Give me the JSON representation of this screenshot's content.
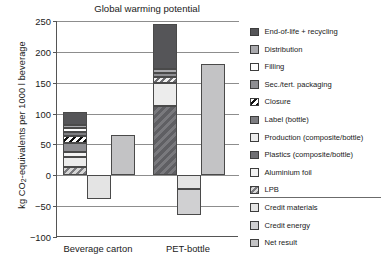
{
  "chart_data": {
    "type": "bar",
    "title": "Global warming potential",
    "xlabel": "",
    "ylabel": "kg CO2-equivalents per 1000 l beverage",
    "ylabel_prefix": "kg CO",
    "ylabel_sub": "2",
    "ylabel_suffix": "-equivalents per 1000 l beverage",
    "ylim": [
      -100,
      250
    ],
    "yticks": [
      250,
      200,
      150,
      100,
      50,
      0,
      -50,
      -100
    ],
    "ytick_labels": [
      "250",
      "200",
      "150",
      "100",
      "50",
      "0",
      "−50",
      "−100"
    ],
    "grid": true,
    "legend_position": "right",
    "categories": [
      "Beverage carton",
      "PET-bottle"
    ],
    "stack_order": [
      "LPB",
      "Production (composite/bottle)",
      "Aluminium foil",
      "Plastics (composite/bottle)",
      "Sec./tert. packaging",
      "Closure",
      "Label (bottle)",
      "Filling",
      "Distribution",
      "End-of-life + recycling"
    ],
    "series": [
      {
        "name": "Beverage carton",
        "stacked_segments": [
          {
            "label": "LPB",
            "value": 14
          },
          {
            "label": "Production (composite/bottle)",
            "value": 16
          },
          {
            "label": "Aluminium foil",
            "value": 8
          },
          {
            "label": "Sec./tert. packaging",
            "value": 14
          },
          {
            "label": "Closure",
            "value": 12
          },
          {
            "label": "Label (bottle)",
            "value": 6
          },
          {
            "label": "Filling",
            "value": 6
          },
          {
            "label": "Distribution",
            "value": 6
          },
          {
            "label": "End-of-life + recycling",
            "value": 21
          }
        ],
        "stack_total": 103,
        "credit_materials": -38,
        "credit_energy": 0,
        "credits_total": -38,
        "net_result": 66
      },
      {
        "name": "PET-bottle",
        "stacked_segments": [
          {
            "label": "Plastics (composite/bottle)",
            "value": 113
          },
          {
            "label": "Production (composite/bottle)",
            "value": 37
          },
          {
            "label": "Closure",
            "value": 10
          },
          {
            "label": "Sec./tert. packaging",
            "value": 5
          },
          {
            "label": "Distribution",
            "value": 7
          },
          {
            "label": "End-of-life + recycling",
            "value": 73
          }
        ],
        "stack_total": 245,
        "credit_materials": -22,
        "credit_energy": -43,
        "credits_total": -65,
        "net_result": 180
      }
    ]
  },
  "legend": {
    "items": [
      {
        "label": "End-of-life + recycling",
        "swatch": "f-eol",
        "color": "#555558"
      },
      {
        "label": "Distribution",
        "swatch": "f-distribution",
        "color": "#a9a9ad"
      },
      {
        "label": "Filling",
        "swatch": "f-filling",
        "color": "#fdfdfd"
      },
      {
        "label": "Sec./tert. packaging",
        "swatch": "f-sec",
        "color": "#8e8e92"
      },
      {
        "label": "Closure",
        "swatch": "f-closure",
        "color": "#111111"
      },
      {
        "label": "Label (bottle)",
        "swatch": "f-label",
        "color": "#7d7d81"
      },
      {
        "label": "Production (composite/bottle)",
        "swatch": "f-production",
        "color": "#ececec"
      },
      {
        "label": "Plastics (composite/bottle)",
        "swatch": "f-plastics",
        "color": "#6f6f73"
      },
      {
        "label": "Aluminium foil",
        "swatch": "f-alu",
        "color": "#f3f3f3"
      },
      {
        "label": "LPB",
        "swatch": "f-lpb",
        "color": "#7a7a7e"
      },
      {
        "label": "Credit materials",
        "swatch": "f-credit-mat",
        "color": "#e4e4e4"
      },
      {
        "label": "Credit energy",
        "swatch": "f-credit-en",
        "color": "#d0d0d2"
      },
      {
        "label": "Net result",
        "swatch": "f-net",
        "color": "#c3c3c5"
      }
    ],
    "divider_after_index": 9
  }
}
